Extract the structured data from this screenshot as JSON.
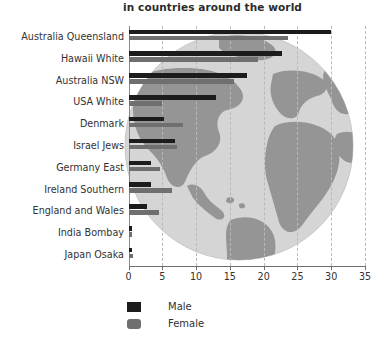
{
  "chart_data": {
    "type": "bar",
    "orientation": "horizontal",
    "title": "in countries around the world",
    "xlabel": "",
    "ylabel": "",
    "xlim": [
      0,
      35
    ],
    "xticks": [
      0,
      5,
      10,
      15,
      20,
      25,
      30,
      35
    ],
    "grid": true,
    "legend_position": "bottom-left",
    "categories": [
      "Australia Queensland",
      "Hawaii White",
      "Australia NSW",
      "USA White",
      "Denmark",
      "Israel Jews",
      "Germany East",
      "Ireland Southern",
      "England and Wales",
      "India Bombay",
      "Japan Osaka"
    ],
    "series": [
      {
        "name": "Male",
        "color": "#1c1c1c",
        "values": [
          30.0,
          22.7,
          17.5,
          12.9,
          5.3,
          6.9,
          3.3,
          3.4,
          2.8,
          0.5,
          0.5
        ]
      },
      {
        "name": "Female",
        "color": "#6f6f6f",
        "values": [
          23.6,
          19.2,
          15.6,
          5.0,
          8.0,
          7.2,
          4.7,
          6.4,
          4.5,
          0.5,
          0.6
        ]
      }
    ]
  },
  "legend": {
    "items": [
      {
        "label": "Male",
        "swatch": "male-swatch"
      },
      {
        "label": "Female",
        "swatch": "female-swatch"
      }
    ]
  },
  "background": {
    "image_name": "world-globe-illustration",
    "globe_fill": "#cfcfcf",
    "land_fill": "#8f8f8f"
  }
}
